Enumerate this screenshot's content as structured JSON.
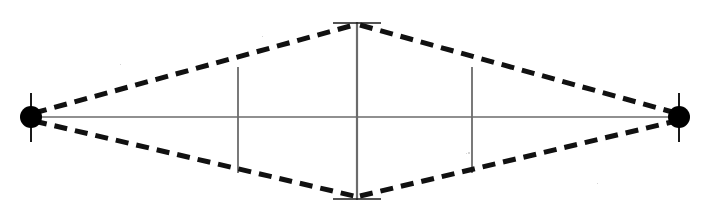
{
  "figure": {
    "canvas": {
      "width": 710,
      "height": 215,
      "background": "#ffffff"
    },
    "colors": {
      "ink": "#1a1a1a",
      "dashed_member": "#111111",
      "thin_member": "#6b6b6b",
      "node_fill": "#000000",
      "background": "#ffffff",
      "scan_speck": "#c9c9c9"
    },
    "nodes": [
      {
        "name": "left-pin-node",
        "label": "",
        "cx": 31,
        "cy": 117,
        "r": 11,
        "pin_line": {
          "x": 31,
          "y1": 93,
          "y2": 142,
          "width": 2
        }
      },
      {
        "name": "right-pin-node",
        "label": "",
        "cx": 679,
        "cy": 117,
        "r": 11,
        "pin_line": {
          "x": 679,
          "y1": 93,
          "y2": 142,
          "width": 2
        }
      }
    ],
    "apexes": [
      {
        "name": "top-apex",
        "x": 357,
        "y": 24
      },
      {
        "name": "bottom-apex",
        "x": 357,
        "y": 197
      }
    ],
    "dashed_members": [
      {
        "name": "upper-left-member",
        "x1": 34,
        "y1": 113,
        "x2": 354,
        "y2": 25
      },
      {
        "name": "upper-right-member",
        "x1": 360,
        "y1": 25,
        "x2": 676,
        "y2": 113
      },
      {
        "name": "lower-left-member",
        "x1": 34,
        "y1": 121,
        "x2": 354,
        "y2": 196
      },
      {
        "name": "lower-right-member",
        "x1": 360,
        "y1": 196,
        "x2": 676,
        "y2": 121
      }
    ],
    "dash_style": {
      "width": 5,
      "dash": 13,
      "gap": 8
    },
    "centerline": {
      "name": "horizontal-centerline",
      "x1": 31,
      "y1": 117,
      "x2": 679,
      "y2": 117,
      "width": 1.6
    },
    "center_post": {
      "name": "center-vertical-post",
      "x": 357,
      "y1": 22,
      "y2": 200,
      "width": 2.2,
      "cap_top": {
        "x1": 333,
        "x2": 381,
        "y": 23,
        "width": 1.6
      },
      "cap_bottom": {
        "x1": 333,
        "x2": 381,
        "y": 199,
        "width": 1.6
      }
    },
    "struts": [
      {
        "name": "left-strut",
        "x": 238,
        "y1": 67,
        "y2": 173,
        "width": 1.8
      },
      {
        "name": "right-strut",
        "x": 472,
        "y1": 67,
        "y2": 173,
        "width": 1.8
      }
    ],
    "specks": [
      {
        "x": 468,
        "y": 152,
        "w": 2,
        "h": 2
      },
      {
        "x": 466,
        "y": 153,
        "w": 1,
        "h": 1
      },
      {
        "x": 262,
        "y": 36,
        "w": 1,
        "h": 1
      },
      {
        "x": 597,
        "y": 183,
        "w": 1,
        "h": 1
      },
      {
        "x": 120,
        "y": 64,
        "w": 1,
        "h": 1
      }
    ]
  }
}
